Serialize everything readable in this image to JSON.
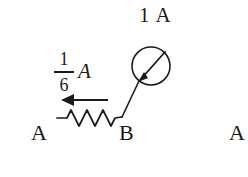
{
  "figure": {
    "type": "circuit-diagram",
    "background_color": "#ffffff",
    "ink_color": "#1a1a1a",
    "width": 248,
    "height": 177
  },
  "labels": {
    "total_current": "1 A",
    "branch_current_numerator": "1",
    "branch_current_denominator": "6",
    "branch_current_unit": "A",
    "node_a_left": "A",
    "node_b": "B",
    "node_a_right": "A"
  },
  "components": {
    "meter": {
      "name": "galvanometer",
      "symbol": "circle-with-diagonal-arrow",
      "center_x": 151,
      "center_y": 66,
      "radius": 19,
      "arrow_direction": "down-left"
    },
    "resistor": {
      "name": "resistor",
      "symbol": "zigzag",
      "x_start": 57,
      "x_end": 122,
      "y": 118,
      "peaks": 3
    },
    "current_arrow": {
      "name": "current-direction-arrow",
      "direction": "left",
      "x_tail": 108,
      "x_head": 62,
      "y": 100
    },
    "lead_meter_to_node_b": {
      "name": "wire",
      "x1": 122,
      "y1": 117,
      "x2": 139,
      "y2": 82
    }
  }
}
